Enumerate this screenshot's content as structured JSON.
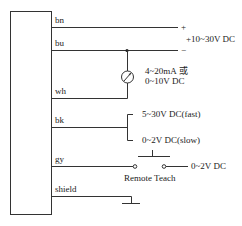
{
  "wires": [
    {
      "id": "bn",
      "label": "bn",
      "terminal": "+"
    },
    {
      "id": "bu",
      "label": "bu",
      "terminal": "−"
    },
    {
      "id": "wh",
      "label": "wh"
    },
    {
      "id": "bk",
      "label": "bk"
    },
    {
      "id": "gy",
      "label": "gy"
    },
    {
      "id": "shield",
      "label": "shield"
    }
  ],
  "supply": {
    "label": "+10~30V DC"
  },
  "analog_output": {
    "line1": "4~20mA 或",
    "line2": "0~10V DC",
    "icon": "meter-icon"
  },
  "bk_options": {
    "fast": "5~30V DC(fast)",
    "slow": "0~2V DC(slow)"
  },
  "teach": {
    "label": "Remote Teach",
    "voltage": "0~2V DC",
    "icon": "switch-icon"
  },
  "ground": {
    "icon": "ground-icon"
  }
}
